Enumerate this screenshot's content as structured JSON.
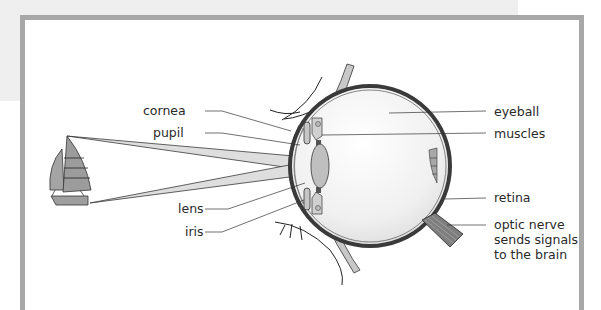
{
  "diagram": {
    "title": "",
    "labels_left": [
      {
        "id": "cornea",
        "text": "cornea",
        "x": 135,
        "y": 104
      },
      {
        "id": "pupil",
        "text": "pupil",
        "x": 135,
        "y": 126
      },
      {
        "id": "lens",
        "text": "lens",
        "x": 135,
        "y": 202
      },
      {
        "id": "iris",
        "text": "iris",
        "x": 135,
        "y": 225
      }
    ],
    "labels_right": [
      {
        "id": "eyeball",
        "text": "eyeball",
        "x": 494,
        "y": 104
      },
      {
        "id": "muscles",
        "text": "muscles",
        "x": 494,
        "y": 126
      },
      {
        "id": "retina",
        "text": "retina",
        "x": 494,
        "y": 190
      },
      {
        "id": "optic-nerve",
        "text": "optic nerve\nsends signals\nto the brain",
        "x": 494,
        "y": 217
      }
    ],
    "object": "sailboat",
    "colors": {
      "frame_border": "#a8a8a8",
      "back_page": "#efefef",
      "light_beam": "#d8d8d8",
      "eye_outline": "#3a3a3a",
      "lens_fill": "#bdbdbd",
      "sail_fill": "#9a9a9a"
    }
  }
}
